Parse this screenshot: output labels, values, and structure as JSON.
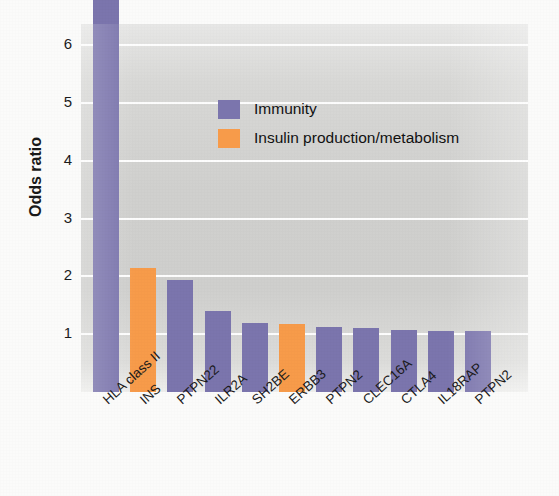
{
  "chart_data": {
    "type": "bar",
    "title": "",
    "xlabel": "",
    "ylabel": "Odds ratio",
    "ylim": [
      0,
      7.1
    ],
    "grid": true,
    "legend_position": "inside-top-center",
    "ytick_labels": [
      "1",
      "2",
      "3",
      "4",
      "5",
      "6"
    ],
    "yticks": [
      1,
      2,
      3,
      4,
      5,
      6
    ],
    "categories": [
      "HLA class II",
      "INS",
      "PTPN22",
      "ILR2A",
      "SH2BE",
      "ERBB3",
      "PTPN2",
      "CLEC16A",
      "CTLA4",
      "IL18RAP",
      "PTPN2"
    ],
    "values": [
      6.95,
      2.15,
      1.93,
      1.4,
      1.2,
      1.18,
      1.12,
      1.1,
      1.08,
      1.06,
      1.05
    ],
    "groups": [
      "Immunity",
      "Insulin production/metabolism",
      "Immunity",
      "Immunity",
      "Immunity",
      "Insulin production/metabolism",
      "Immunity",
      "Immunity",
      "Immunity",
      "Immunity",
      "Immunity"
    ],
    "legend": [
      {
        "label": "Immunity",
        "color": "#7b75ad"
      },
      {
        "label": "Insulin production/metabolism",
        "color": "#f79b4a"
      }
    ],
    "colors": {
      "immunity": "#7b75ad",
      "insulin": "#f79b4a",
      "plot_background": "#d2d2d0",
      "gridline": "#ffffff",
      "figure_background": "#fbfbfa",
      "text": "#1a1a1a"
    }
  }
}
